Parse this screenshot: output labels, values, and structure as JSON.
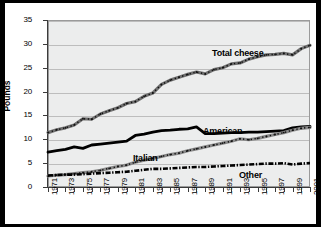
{
  "chart_data": {
    "type": "line",
    "title": "",
    "xlabel": "",
    "ylabel": "Pounds",
    "ylim": [
      0,
      35
    ],
    "ytick_step": 5,
    "ytick_labels": [
      "0",
      "5",
      "10",
      "15",
      "20",
      "25",
      "30",
      "35"
    ],
    "grid": true,
    "legend_position": "inline-annotations",
    "xlim": [
      1971,
      2001
    ],
    "x": [
      1971,
      1972,
      1973,
      1974,
      1975,
      1976,
      1977,
      1978,
      1979,
      1980,
      1981,
      1982,
      1983,
      1984,
      1985,
      1986,
      1987,
      1988,
      1989,
      1990,
      1991,
      1992,
      1993,
      1994,
      1995,
      1996,
      1997,
      1998,
      1999,
      2000,
      2001
    ],
    "xtick_labels": [
      "1971",
      "1973",
      "1975",
      "1977",
      "1979",
      "1981",
      "1983",
      "1985",
      "1987",
      "1989",
      "1991",
      "1993",
      "1995",
      "1997",
      "1999",
      "2001"
    ],
    "series": [
      {
        "name": "Total cheese",
        "color": "#707070",
        "style": "solid-gray-marker",
        "values": [
          11.4,
          12.0,
          12.4,
          13.0,
          14.3,
          14.2,
          15.3,
          16.0,
          16.6,
          17.5,
          17.9,
          19.0,
          19.7,
          21.5,
          22.4,
          23.0,
          23.6,
          24.1,
          23.7,
          24.6,
          25.0,
          25.8,
          26.0,
          26.8,
          27.3,
          27.7,
          27.8,
          28.0,
          27.7,
          29.0,
          29.7
        ]
      },
      {
        "name": "American",
        "color": "#000000",
        "style": "solid-black-thick",
        "values": [
          7.3,
          7.6,
          7.9,
          8.4,
          8.1,
          8.8,
          9.0,
          9.2,
          9.4,
          9.6,
          10.8,
          11.1,
          11.5,
          11.8,
          11.9,
          12.1,
          12.2,
          12.6,
          11.2,
          11.2,
          11.3,
          11.4,
          11.4,
          11.5,
          11.5,
          11.6,
          11.7,
          11.8,
          12.4,
          12.6,
          12.7
        ]
      },
      {
        "name": "Italian",
        "color": "#8a8a8a",
        "style": "solid-gray-marker",
        "values": [
          2.3,
          2.5,
          2.6,
          2.8,
          3.0,
          3.2,
          3.5,
          3.9,
          4.3,
          4.6,
          5.2,
          5.6,
          6.0,
          6.4,
          6.8,
          7.1,
          7.6,
          8.0,
          8.4,
          8.8,
          9.2,
          9.6,
          10.1,
          9.9,
          10.2,
          10.6,
          11.0,
          11.4,
          11.9,
          12.3,
          12.5
        ]
      },
      {
        "name": "Other",
        "color": "#000000",
        "style": "dashed-black",
        "values": [
          2.4,
          2.5,
          2.6,
          2.6,
          2.7,
          2.8,
          2.9,
          3.0,
          3.1,
          3.2,
          3.4,
          3.6,
          3.8,
          3.8,
          3.9,
          4.0,
          4.1,
          4.2,
          4.2,
          4.3,
          4.4,
          4.5,
          4.6,
          4.7,
          4.8,
          4.9,
          4.9,
          5.0,
          4.7,
          4.9,
          5.0
        ]
      }
    ]
  },
  "labels": {
    "total_cheese": "Total cheese",
    "american": "American",
    "italian": "Italian",
    "other": "Other",
    "y_axis_title": "Pounds"
  }
}
